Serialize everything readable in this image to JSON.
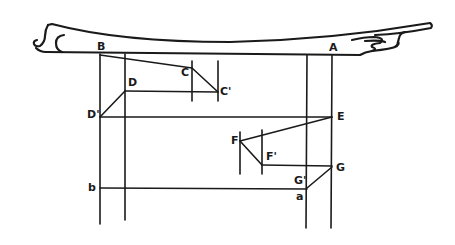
{
  "diagram": {
    "type": "construction diagram of a roof beam with projected points",
    "stroke_color": "#1a1a1a",
    "background": "#ffffff",
    "labels": {
      "B": "B",
      "A": "A",
      "C": "C",
      "C_prime": "C'",
      "D": "D",
      "D_prime": "D'",
      "E": "E",
      "F": "F",
      "F_prime": "F'",
      "G": "G",
      "G_prime": "G'",
      "a": "a",
      "b": "b"
    }
  }
}
